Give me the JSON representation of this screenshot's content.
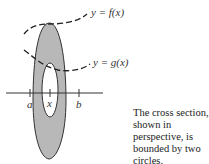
{
  "diagram": {
    "curves": [
      {
        "id": "f",
        "label": "y = f(x)"
      },
      {
        "id": "g",
        "label": "y = g(x)"
      }
    ],
    "axis_ticks": [
      {
        "id": "a",
        "label": "a"
      },
      {
        "id": "x",
        "label": "x"
      },
      {
        "id": "b",
        "label": "b"
      }
    ],
    "caption": "The cross section, shown in perspective, is bounded by two circles.",
    "colors": {
      "ring_fill": "#b8b8b8",
      "outline": "#333333",
      "hole_fill": "#ffffff"
    }
  }
}
